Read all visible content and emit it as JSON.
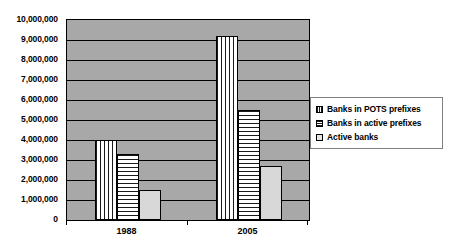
{
  "chart_data": {
    "type": "bar",
    "title": "",
    "subtitle": "",
    "xlabel": "",
    "ylabel": "",
    "categories": [
      "1988",
      "2005"
    ],
    "series": [
      {
        "name": "Banks in POTS prefixes",
        "pattern": "vertical-stripes",
        "values": [
          4000000,
          9200000
        ]
      },
      {
        "name": "Banks in active prefixes",
        "pattern": "horizontal-stripes",
        "values": [
          3300000,
          5500000
        ]
      },
      {
        "name": "Active banks",
        "pattern": "solid-light-gray",
        "values": [
          1500000,
          2700000
        ]
      }
    ],
    "ylim": [
      0,
      10000000
    ],
    "ytick_values": [
      0,
      1000000,
      2000000,
      3000000,
      4000000,
      5000000,
      6000000,
      7000000,
      8000000,
      9000000,
      10000000
    ],
    "ytick_labels": [
      "0",
      "1,000,000",
      "2,000,000",
      "3,000,000",
      "4,000,000",
      "5,000,000",
      "6,000,000",
      "7,000,000",
      "8,000,000",
      "9,000,000",
      "10,000,000"
    ],
    "grid": true,
    "grid_axis": "y",
    "legend_position": "right",
    "plot_background_color": "#a8a8a8",
    "figure_background_color": "#ffffff",
    "axis_color": "#000000"
  },
  "legend": {
    "items": [
      {
        "label": "Banks in POTS prefixes"
      },
      {
        "label": "Banks in active prefixes"
      },
      {
        "label": "Active banks"
      }
    ]
  }
}
